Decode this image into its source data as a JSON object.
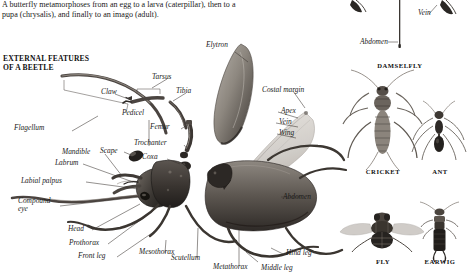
{
  "intro": {
    "text": "A butterfly metamorphoses from an egg to a larva (caterpillar), then to a pupa (chrysalis), and finally to an imago (adult)."
  },
  "section": {
    "title_line1": "EXTERNAL FEATURES",
    "title_line2": "OF A BEETLE"
  },
  "beetle_labels": [
    {
      "id": "flagellum",
      "text": "Flagellum"
    },
    {
      "id": "claw",
      "text": "Claw"
    },
    {
      "id": "tarsus",
      "text": "Tarsus"
    },
    {
      "id": "tibia",
      "text": "Tibia"
    },
    {
      "id": "pedicel",
      "text": "Pedicel"
    },
    {
      "id": "femur",
      "text": "Femur"
    },
    {
      "id": "trochanter",
      "text": "Trochanter"
    },
    {
      "id": "coxa",
      "text": "Coxa"
    },
    {
      "id": "scape",
      "text": "Scape"
    },
    {
      "id": "mandible",
      "text": "Mandible"
    },
    {
      "id": "labrum",
      "text": "Labrum"
    },
    {
      "id": "labial-palpus",
      "text": "Labial palpus"
    },
    {
      "id": "compound-eye",
      "text": "Compound eye"
    },
    {
      "id": "head",
      "text": "Head"
    },
    {
      "id": "prothorax",
      "text": "Prothorax"
    },
    {
      "id": "front-leg",
      "text": "Front leg"
    },
    {
      "id": "mesothorax",
      "text": "Mesothorax"
    },
    {
      "id": "scutellum",
      "text": "Scutellum"
    },
    {
      "id": "metathorax",
      "text": "Metathorax"
    },
    {
      "id": "middle-leg",
      "text": "Middle leg"
    },
    {
      "id": "hind-leg",
      "text": "Hind leg"
    },
    {
      "id": "abdomen",
      "text": "Abdomen"
    },
    {
      "id": "elytron",
      "text": "Elytron"
    },
    {
      "id": "costal-margin",
      "text": "Costal margin"
    },
    {
      "id": "apex",
      "text": "Apex"
    },
    {
      "id": "vein",
      "text": "Vein"
    },
    {
      "id": "wing",
      "text": "Wing"
    }
  ],
  "damselfly": {
    "caption": "DAMSELFLY",
    "labels": [
      {
        "id": "vein",
        "text": "Vein"
      },
      {
        "id": "abdomen",
        "text": "Abdomen"
      }
    ]
  },
  "specimens": [
    {
      "id": "cricket",
      "caption": "CRICKET"
    },
    {
      "id": "ant",
      "caption": "ANT"
    },
    {
      "id": "fly",
      "caption": "FLY"
    },
    {
      "id": "earwig",
      "caption": "EARWIG"
    }
  ],
  "colors": {
    "page_background": "#ffffff",
    "text": "#1a1a1a",
    "leader_line": "#3a3a3a",
    "specimen_dark": "#2b2724",
    "specimen_mid": "#6d6660",
    "specimen_light": "#b4aea7",
    "wing_translucent": "#cfcbc6"
  }
}
